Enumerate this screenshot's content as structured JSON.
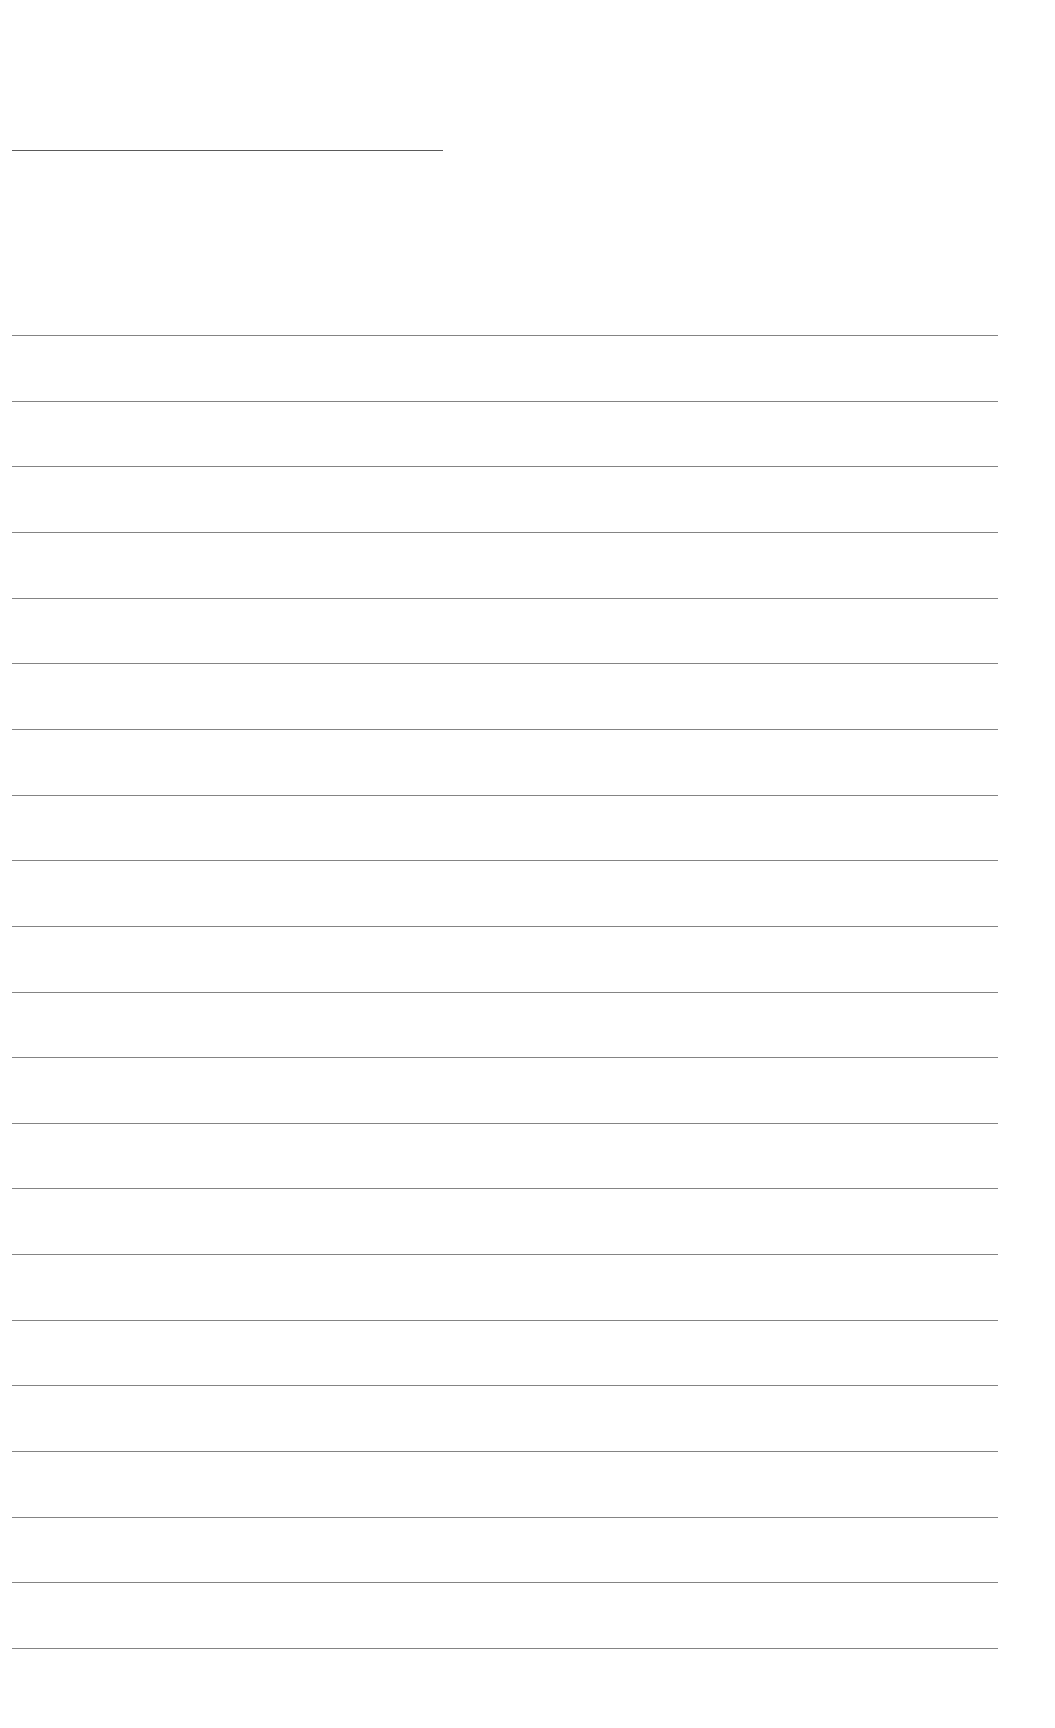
{
  "document": {
    "type": "lined-paper",
    "background": "#ffffff",
    "line_color": "#6e6e6e",
    "title_line": {
      "x": 12,
      "y": 150,
      "width": 431
    },
    "ruled_lines": {
      "count": 21,
      "x_start": 12,
      "x_end": 998,
      "first_y": 335,
      "spacing": 65.65
    }
  }
}
